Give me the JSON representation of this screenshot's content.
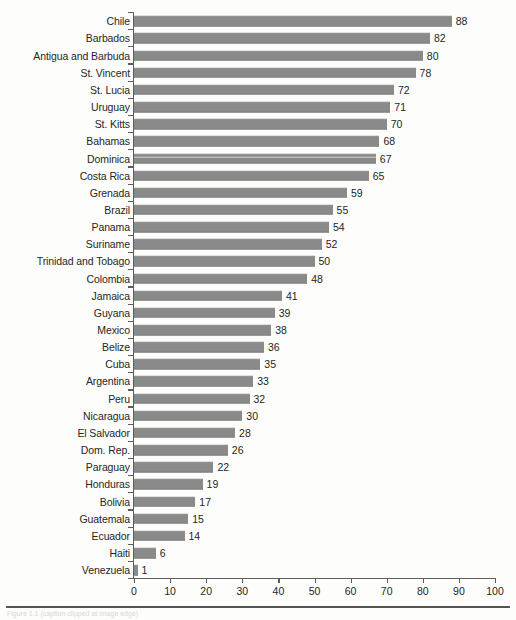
{
  "chart_data": {
    "type": "bar",
    "orientation": "horizontal",
    "title": "",
    "subtitle": "",
    "xlabel": "",
    "ylabel": "",
    "xlim": [
      0,
      100
    ],
    "xticks": [
      0,
      10,
      20,
      30,
      40,
      50,
      60,
      70,
      80,
      90,
      100
    ],
    "grid": false,
    "legend": false,
    "bar_color": "#8a8a8a",
    "axis_color": "#5d5d5d",
    "value_labels_shown": true,
    "categories": [
      "Chile",
      "Barbados",
      "Antigua and Barbuda",
      "St. Vincent",
      "St. Lucia",
      "Uruguay",
      "St. Kitts",
      "Bahamas",
      "Dominica",
      "Costa Rica",
      "Grenada",
      "Brazil",
      "Panama",
      "Suriname",
      "Trinidad and Tobago",
      "Colombia",
      "Jamaica",
      "Guyana",
      "Mexico",
      "Belize",
      "Cuba",
      "Argentina",
      "Peru",
      "Nicaragua",
      "El Salvador",
      "Dom. Rep.",
      "Paraguay",
      "Honduras",
      "Bolivia",
      "Guatemala",
      "Ecuador",
      "Haiti",
      "Venezuela"
    ],
    "values": [
      88,
      82,
      80,
      78,
      72,
      71,
      70,
      68,
      67,
      65,
      59,
      55,
      54,
      52,
      50,
      48,
      41,
      39,
      38,
      36,
      35,
      33,
      32,
      30,
      28,
      26,
      22,
      19,
      17,
      15,
      14,
      6,
      1
    ]
  },
  "footer": {
    "caption": "Figure 1.1  (caption clipped at image edge)"
  }
}
